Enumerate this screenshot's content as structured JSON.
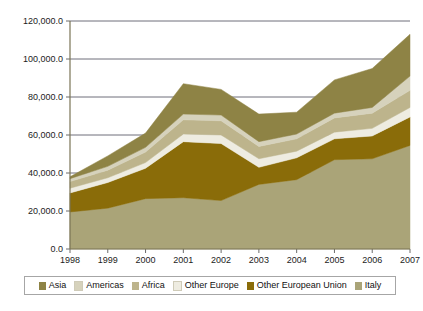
{
  "chart_data": {
    "type": "area",
    "stacked": true,
    "title": "",
    "xlabel": "",
    "ylabel": "",
    "categories": [
      "1998",
      "1999",
      "2000",
      "2001",
      "2002",
      "2003",
      "2004",
      "2005",
      "2006",
      "2007"
    ],
    "x": [
      1998,
      1999,
      2000,
      2001,
      2002,
      2003,
      2004,
      2005,
      2006,
      2007
    ],
    "ylim": [
      0,
      120000
    ],
    "ytick_values": [
      0,
      20000,
      40000,
      60000,
      80000,
      100000,
      120000
    ],
    "ytick_labels": [
      "0.0",
      "20,000.0",
      "40,000.0",
      "60,000.0",
      "80,000.0",
      "100,000.0",
      "120,000.0"
    ],
    "grid": true,
    "grid_axis": "y",
    "legend_position": "bottom",
    "stack_order_bottom_to_top": [
      "Italy",
      "Other European Union",
      "Other Europe",
      "Africa",
      "Americas",
      "Asia"
    ],
    "series": [
      {
        "name": "Italy",
        "color": "#aaa478",
        "values": [
          19500,
          21500,
          26500,
          27000,
          25500,
          34000,
          36500,
          47000,
          47500,
          54500
        ]
      },
      {
        "name": "Other European Union",
        "color": "#8a6c09",
        "values": [
          10000,
          13500,
          16000,
          29500,
          30000,
          9000,
          11500,
          11000,
          12000,
          15000
        ]
      },
      {
        "name": "Other Europe",
        "color": "#eeece1",
        "values": [
          2500,
          2500,
          3000,
          4000,
          4500,
          4500,
          3500,
          3500,
          4000,
          5000
        ]
      },
      {
        "name": "Africa",
        "color": "#bdb48c",
        "values": [
          3500,
          4000,
          5500,
          7500,
          7500,
          6500,
          6500,
          7500,
          8000,
          9000
        ]
      },
      {
        "name": "Americas",
        "color": "#d6d2bc",
        "values": [
          1500,
          2000,
          2500,
          3000,
          3000,
          2500,
          2500,
          2500,
          3000,
          7500
        ]
      },
      {
        "name": "Asia",
        "color": "#8e8345",
        "values": [
          1000,
          5500,
          7500,
          16000,
          13500,
          14500,
          11500,
          17500,
          20500,
          22000
        ]
      }
    ],
    "cumulative_tops": [
      38000,
      49000,
      61000,
      87000,
      84000,
      71000,
      72000,
      89000,
      95000,
      113000
    ]
  },
  "legend": {
    "items": [
      {
        "label": "Asia",
        "color": "#8e8345"
      },
      {
        "label": "Americas",
        "color": "#d6d2bc"
      },
      {
        "label": "Africa",
        "color": "#bdb48c"
      },
      {
        "label": "Other Europe",
        "color": "#eeece1"
      },
      {
        "label": "Other European Union",
        "color": "#8a6c09"
      },
      {
        "label": "Italy",
        "color": "#aaa478"
      }
    ]
  },
  "axes": {
    "axis_color": "#7a7455",
    "grid_color": "#6f6f7a",
    "tick_color": "#6b6b6b"
  }
}
